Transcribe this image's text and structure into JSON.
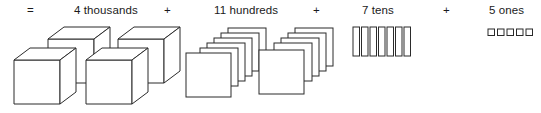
{
  "expression": {
    "leading_operator": "=",
    "terms": [
      {
        "count": 4,
        "unit": "thousands",
        "label": "4 thousands",
        "operator_after": "+"
      },
      {
        "count": 11,
        "unit": "hundreds",
        "label": "11 hundreds",
        "operator_after": "+"
      },
      {
        "count": 7,
        "unit": "tens",
        "label": "7 tens",
        "operator_after": "+"
      },
      {
        "count": 5,
        "unit": "ones",
        "label": "5 ones",
        "operator_after": ""
      }
    ]
  },
  "blocks": {
    "thousands": {
      "shape": "cube",
      "total": 4,
      "groups": [
        2,
        2
      ]
    },
    "hundreds": {
      "shape": "flat-square",
      "total": 11,
      "groups": [
        6,
        5
      ]
    },
    "tens": {
      "shape": "vertical-rod",
      "total": 7
    },
    "ones": {
      "shape": "unit-square",
      "total": 5
    }
  },
  "colors": {
    "background": "#ffffff",
    "stroke": "#2b2b2b",
    "fill": "#ffffff",
    "text": "#1a1a1a"
  }
}
